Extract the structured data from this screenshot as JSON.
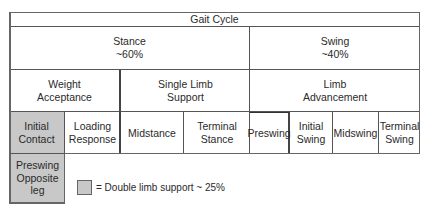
{
  "diagram": {
    "title": "Gait Cycle",
    "periods": [
      {
        "label": "Stance\n~60%"
      },
      {
        "label": "Swing\n~40%"
      }
    ],
    "tasks": [
      {
        "label": "Weight\nAcceptance"
      },
      {
        "label": "Single Limb\nSupport"
      },
      {
        "label": "Limb\nAdvancement"
      }
    ],
    "phases": [
      {
        "label": "Initial\nContact",
        "double_limb_support": true
      },
      {
        "label": "Loading\nResponse",
        "double_limb_support": false
      },
      {
        "label": "Midstance",
        "double_limb_support": false
      },
      {
        "label": "Terminal\nStance",
        "double_limb_support": false
      },
      {
        "label": "Preswing",
        "double_limb_support": false
      },
      {
        "label": "Initial\nSwing",
        "double_limb_support": false
      },
      {
        "label": "Midswing",
        "double_limb_support": false
      },
      {
        "label": "Terminal\nSwing",
        "double_limb_support": false
      }
    ],
    "opposite_leg": {
      "label": "Preswing\nOpposite leg",
      "double_limb_support": true
    },
    "legend": {
      "label": "= Double limb support ~ 25%",
      "swatch_color": "#c8c8c8"
    }
  }
}
